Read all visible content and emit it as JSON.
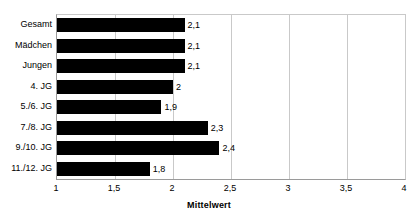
{
  "chart_data": {
    "type": "bar",
    "orientation": "horizontal",
    "title": "",
    "xlabel": "Mittelwert",
    "ylabel": "",
    "xlim": [
      1,
      4
    ],
    "xticks": [
      "1",
      "1,5",
      "2",
      "2,5",
      "3",
      "3,5",
      "4"
    ],
    "xtick_values": [
      1,
      1.5,
      2,
      2.5,
      3,
      3.5,
      4
    ],
    "grid": true,
    "legend": false,
    "bar_color": "#000000",
    "categories": [
      "Gesamt",
      "Mädchen",
      "Jungen",
      "4. JG",
      "5./6. JG",
      "7./8. JG",
      "9./10. JG",
      "11./12. JG"
    ],
    "values": [
      2.1,
      2.1,
      2.1,
      2.0,
      1.9,
      2.3,
      2.4,
      1.8
    ],
    "data_labels": [
      "2,1",
      "2,1",
      "2,1",
      "2",
      "1,9",
      "2,3",
      "2,4",
      "1,8"
    ]
  },
  "colors": {
    "bar": "#000000",
    "gridline": "#c9c9c9",
    "axis": "#9a9a9a",
    "background": "#ffffff",
    "text": "#000000"
  }
}
